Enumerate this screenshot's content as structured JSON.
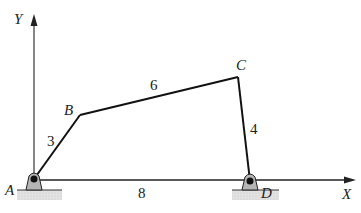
{
  "diagram": {
    "type": "four-bar-linkage",
    "axes": {
      "x_label": "X",
      "y_label": "Y"
    },
    "points": [
      {
        "id": "A",
        "label": "A"
      },
      {
        "id": "B",
        "label": "B"
      },
      {
        "id": "C",
        "label": "C"
      },
      {
        "id": "D",
        "label": "D"
      }
    ],
    "links": [
      {
        "from": "A",
        "to": "B",
        "length": "3"
      },
      {
        "from": "B",
        "to": "C",
        "length": "6"
      },
      {
        "from": "C",
        "to": "D",
        "length": "4"
      },
      {
        "from": "A",
        "to": "D",
        "length": "8"
      }
    ],
    "colors": {
      "link": "#111111",
      "pivot_fill": "#b5b5b5",
      "ground": "#d6d6d6",
      "pin": "#111111"
    }
  }
}
